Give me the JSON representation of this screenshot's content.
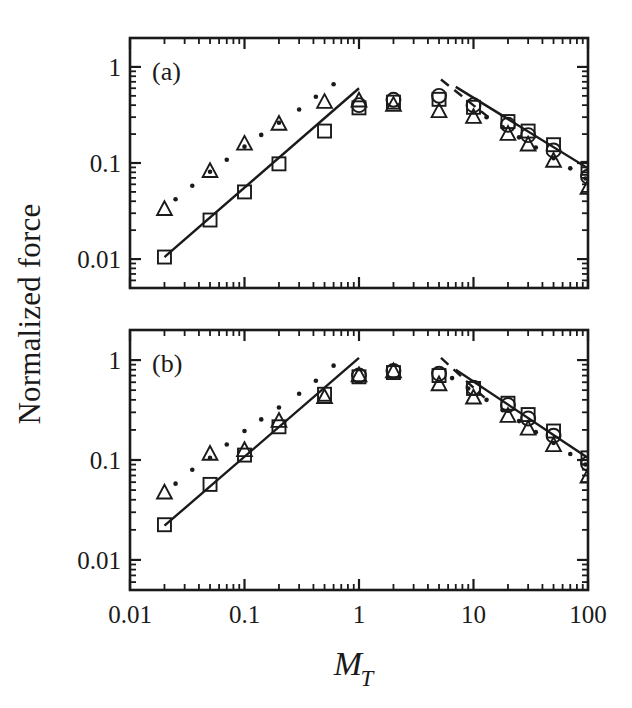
{
  "figure": {
    "xlabel_main": "M",
    "xlabel_sub": "T",
    "ylabel": "Normalized force",
    "background": "#ffffff",
    "ink": "#1a1a1a"
  },
  "axis": {
    "x_tick_labels": [
      "0.01",
      "0.1",
      "1",
      "10",
      "100"
    ],
    "x_tick_values": [
      0.01,
      0.1,
      1,
      10,
      100
    ],
    "y_tick_labels": [
      "1",
      "0.1",
      "0.01"
    ],
    "y_tick_values": [
      1,
      0.1,
      0.01
    ]
  },
  "panels": [
    {
      "tag": "(a)",
      "index": 0
    },
    {
      "tag": "(b)",
      "index": 1
    }
  ],
  "chart_data": {
    "type": "scatter",
    "title": "",
    "xlabel": "M_T",
    "ylabel": "Normalized force",
    "xscale": "log",
    "yscale": "log",
    "xlim": [
      0.01,
      100
    ],
    "ylim": [
      0.005,
      2
    ],
    "grid": false,
    "legend": "none",
    "marker_types": [
      "square",
      "circle",
      "triangle"
    ],
    "panels": [
      {
        "tag": "(a)",
        "ylim": [
          0.005,
          2
        ],
        "series": [
          {
            "name": "square",
            "marker": "square",
            "points": [
              [
                0.02,
                0.0105
              ],
              [
                0.05,
                0.0255
              ],
              [
                0.1,
                0.05
              ],
              [
                0.2,
                0.098
              ],
              [
                0.5,
                0.215
              ],
              [
                1.0,
                0.375
              ],
              [
                2.0,
                0.43
              ],
              [
                5.0,
                0.46
              ],
              [
                10.0,
                0.38
              ],
              [
                20.0,
                0.27
              ],
              [
                30.0,
                0.215
              ],
              [
                50.0,
                0.155
              ],
              [
                100.0,
                0.088
              ]
            ]
          },
          {
            "name": "circle",
            "marker": "circle",
            "points": [
              [
                1.0,
                0.4
              ],
              [
                2.0,
                0.455
              ],
              [
                5.0,
                0.5
              ],
              [
                10.0,
                0.4
              ],
              [
                20.0,
                0.25
              ],
              [
                30.0,
                0.195
              ],
              [
                50.0,
                0.135
              ],
              [
                100.0,
                0.072
              ]
            ]
          },
          {
            "name": "triangle",
            "marker": "triangle",
            "points": [
              [
                0.02,
                0.033
              ],
              [
                0.05,
                0.082
              ],
              [
                0.1,
                0.158
              ],
              [
                0.2,
                0.255
              ],
              [
                0.5,
                0.43
              ],
              [
                1.0,
                0.445
              ],
              [
                2.0,
                0.4
              ],
              [
                5.0,
                0.345
              ],
              [
                10.0,
                0.3
              ],
              [
                20.0,
                0.2
              ],
              [
                30.0,
                0.155
              ],
              [
                50.0,
                0.105
              ],
              [
                100.0,
                0.055
              ]
            ]
          },
          {
            "name": "dotted-reference",
            "marker": "dot",
            "points": [
              [
                0.025,
                0.042
              ],
              [
                0.035,
                0.058
              ],
              [
                0.05,
                0.081
              ],
              [
                0.07,
                0.108
              ],
              [
                0.1,
                0.148
              ],
              [
                0.14,
                0.196
              ],
              [
                0.2,
                0.262
              ],
              [
                0.3,
                0.36
              ],
              [
                0.42,
                0.49
              ],
              [
                0.6,
                0.66
              ],
              [
                13.0,
                0.3
              ],
              [
                18.0,
                0.235
              ],
              [
                25.0,
                0.185
              ],
              [
                35.0,
                0.145
              ],
              [
                50.0,
                0.112
              ],
              [
                70.0,
                0.088
              ],
              [
                95.0,
                0.069
              ]
            ]
          }
        ],
        "fit_lines": [
          {
            "style": "solid",
            "x": [
              0.02,
              1.0
            ],
            "y": [
              0.0105,
              0.6
            ]
          },
          {
            "style": "solid",
            "x": [
              7.0,
              100.0
            ],
            "y": [
              0.62,
              0.088
            ]
          },
          {
            "style": "dashed",
            "x": [
              5.2,
              13.5
            ],
            "y": [
              0.74,
              0.3
            ]
          }
        ]
      },
      {
        "tag": "(b)",
        "ylim": [
          0.005,
          2
        ],
        "series": [
          {
            "name": "square",
            "marker": "square",
            "points": [
              [
                0.02,
                0.0225
              ],
              [
                0.05,
                0.057
              ],
              [
                0.1,
                0.112
              ],
              [
                0.2,
                0.215
              ],
              [
                0.5,
                0.455
              ],
              [
                1.0,
                0.68
              ],
              [
                2.0,
                0.75
              ],
              [
                5.0,
                0.7
              ],
              [
                10.0,
                0.52
              ],
              [
                20.0,
                0.37
              ],
              [
                30.0,
                0.285
              ],
              [
                50.0,
                0.195
              ],
              [
                100.0,
                0.105
              ]
            ]
          },
          {
            "name": "circle",
            "marker": "circle",
            "points": [
              [
                1.0,
                0.7
              ],
              [
                2.0,
                0.78
              ],
              [
                5.0,
                0.73
              ],
              [
                10.0,
                0.53
              ],
              [
                20.0,
                0.355
              ],
              [
                30.0,
                0.26
              ],
              [
                50.0,
                0.175
              ],
              [
                100.0,
                0.092
              ]
            ]
          },
          {
            "name": "triangle",
            "marker": "triangle",
            "points": [
              [
                0.02,
                0.047
              ],
              [
                0.05,
                0.115
              ],
              [
                0.1,
                0.125
              ],
              [
                0.2,
                0.245
              ],
              [
                0.5,
                0.425
              ],
              [
                1.0,
                0.7
              ],
              [
                2.0,
                0.77
              ],
              [
                5.0,
                0.57
              ],
              [
                10.0,
                0.42
              ],
              [
                20.0,
                0.275
              ],
              [
                30.0,
                0.205
              ],
              [
                50.0,
                0.14
              ],
              [
                100.0,
                0.068
              ]
            ]
          },
          {
            "name": "dotted-reference",
            "marker": "dot",
            "points": [
              [
                0.025,
                0.058
              ],
              [
                0.035,
                0.08
              ],
              [
                0.05,
                0.105
              ],
              [
                0.07,
                0.143
              ],
              [
                0.1,
                0.195
              ],
              [
                0.14,
                0.255
              ],
              [
                0.2,
                0.335
              ],
              [
                0.3,
                0.46
              ],
              [
                0.42,
                0.62
              ],
              [
                0.6,
                0.88
              ],
              [
                6.5,
                0.66
              ],
              [
                9.0,
                0.52
              ],
              [
                13.0,
                0.4
              ],
              [
                18.0,
                0.315
              ],
              [
                25.0,
                0.245
              ],
              [
                35.0,
                0.19
              ],
              [
                50.0,
                0.148
              ],
              [
                70.0,
                0.115
              ],
              [
                95.0,
                0.09
              ]
            ]
          }
        ],
        "fit_lines": [
          {
            "style": "solid",
            "x": [
              0.02,
              1.0
            ],
            "y": [
              0.022,
              1.05
            ]
          },
          {
            "style": "solid",
            "x": [
              7.0,
              100.0
            ],
            "y": [
              0.8,
              0.105
            ]
          },
          {
            "style": "dashed",
            "x": [
              5.2,
              12.5
            ],
            "y": [
              1.05,
              0.42
            ]
          }
        ]
      }
    ]
  }
}
